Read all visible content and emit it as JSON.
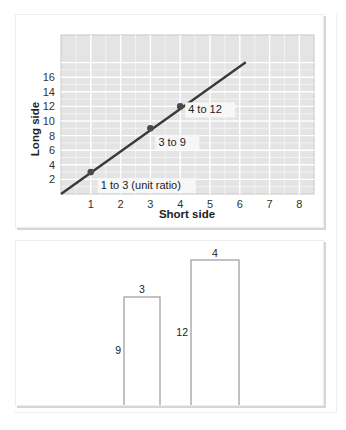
{
  "chart_data": [
    {
      "type": "line",
      "title": "",
      "xlabel": "Short side",
      "ylabel": "Long side",
      "x_ticks": [
        "1",
        "2",
        "3",
        "4",
        "5",
        "6",
        "7",
        "8"
      ],
      "y_ticks": [
        "2",
        "4",
        "6",
        "8",
        "10",
        "12",
        "14",
        "16"
      ],
      "xlim": [
        0,
        8.5
      ],
      "ylim": [
        0,
        19
      ],
      "grid": true,
      "series": [
        {
          "name": "ratio line (long = 3 × short)",
          "x": [
            0,
            6.2
          ],
          "y": [
            0,
            18.6
          ],
          "color": "#3a3a3a"
        }
      ],
      "points": [
        {
          "x": 1,
          "y": 3,
          "label": "1 to 3 (unit ratio)"
        },
        {
          "x": 3,
          "y": 9,
          "label": "3 to 9"
        },
        {
          "x": 4,
          "y": 12,
          "label": "4 to 12"
        }
      ],
      "colors": {
        "plot_bg": "#e4e4e4",
        "grid_major": "#ffffff",
        "grid_minor": "#f2f2f2",
        "line": "#3a3a3a",
        "marker": "#4a4a4a",
        "label_bg": "#f7f7f7"
      }
    },
    {
      "type": "diagram",
      "title": "",
      "rectangles": [
        {
          "width_label": "3",
          "height_label": "9"
        },
        {
          "width_label": "4",
          "height_label": "12"
        }
      ],
      "colors": {
        "stroke": "#9a9a9a"
      }
    }
  ]
}
